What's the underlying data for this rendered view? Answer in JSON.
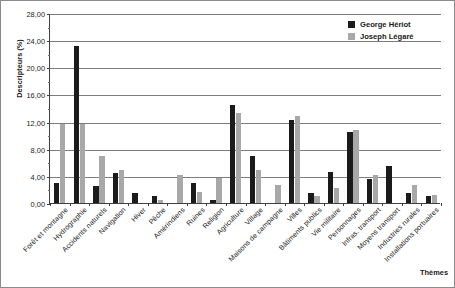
{
  "chart_data": {
    "type": "bar",
    "title": "",
    "xlabel": "Thèmes",
    "ylabel": "Descripteurs (%)",
    "ylim": [
      0,
      28
    ],
    "ytick_step": 4,
    "ytick_labels": [
      "0,00",
      "4,00",
      "8,00",
      "12,00",
      "16,00",
      "20,00",
      "24,00",
      "28,00"
    ],
    "grid": "horizontal",
    "legend_position": "top-right",
    "categories": [
      "Forêt et montagne",
      "Hydrographie",
      "Accidents naturels",
      "Navigation",
      "Hiver",
      "Pêche",
      "Amérindiens",
      "Ruines",
      "Religion",
      "Agriculture",
      "Village",
      "Maisons de campagne",
      "Villes",
      "Bâtiments publics",
      "Vie militaire",
      "Personnages",
      "Infras. transport",
      "Moyens transport",
      "Industries rurales",
      "Installations portuaires"
    ],
    "series": [
      {
        "name": "George Hériot",
        "color": "#1b1b1b",
        "values": [
          3.0,
          23.1,
          2.5,
          4.4,
          1.5,
          1.0,
          0.0,
          3.0,
          0.5,
          14.4,
          6.9,
          0.0,
          12.3,
          1.5,
          4.5,
          10.4,
          3.5,
          5.5,
          1.5,
          1.1
        ]
      },
      {
        "name": "Joseph Légaré",
        "color": "#a8a8a8",
        "values": [
          11.7,
          11.7,
          6.9,
          4.8,
          0.0,
          0.5,
          4.2,
          1.6,
          3.7,
          13.3,
          4.8,
          2.7,
          12.8,
          1.1,
          2.2,
          10.7,
          4.2,
          0.0,
          2.7,
          1.2
        ]
      }
    ]
  },
  "legend": {
    "entries": [
      {
        "label": "George Hériot"
      },
      {
        "label": "Joseph Légaré"
      }
    ]
  }
}
